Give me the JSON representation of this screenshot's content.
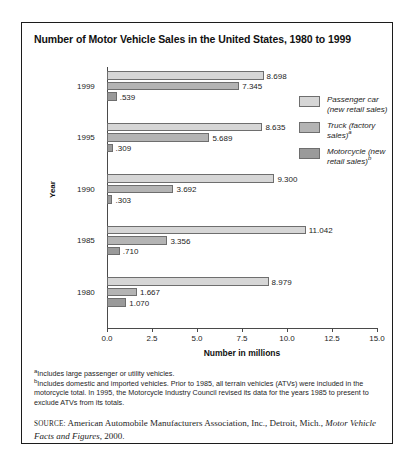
{
  "figure": {
    "title": "Number of Motor Vehicle Sales in the United States, 1980 to 1999",
    "xtitle": "Number in millions",
    "ytitle": "Year"
  },
  "legend": [
    {
      "label_line1": "Passenger car",
      "label_line2": "(new retail sales)",
      "sup": ""
    },
    {
      "label_line1": "Truck (factory",
      "label_line2": "sales)",
      "sup": "a"
    },
    {
      "label_line1": "Motorcycle (new",
      "label_line2": "retail sales)",
      "sup": "b"
    }
  ],
  "notes": {
    "a_sup": "a",
    "a_text": "Includes large passenger or utility vehicles.",
    "b_sup": "b",
    "b_text": "Includes domestic and imported vehicles. Prior to 1985, all terrain vehicles (ATVs) were included in the motorcycle total. In 1995, the Motorcycle Industry Council revised its data for the years 1985 to present to exclude ATVs from its totals.",
    "source_label": "SOURCE:",
    "source_text": " American Automobile Manufacturers Association, Inc., Detroit, Mich., ",
    "source_italic": "Motor Vehicle Facts and Figures",
    "source_tail": ", 2000."
  },
  "chart_data": {
    "type": "bar",
    "orientation": "horizontal",
    "title": "Number of Motor Vehicle Sales in the United States, 1980 to 1999",
    "xlabel": "Number in millions",
    "ylabel": "Year",
    "xlim": [
      0.0,
      15.0
    ],
    "xticks": [
      "0.0",
      "2.5",
      "5.0",
      "7.5",
      "10.0",
      "12.5",
      "15.0"
    ],
    "xtick_values": [
      0.0,
      2.5,
      5.0,
      7.5,
      10.0,
      12.5,
      15.0
    ],
    "grid": false,
    "legend_position": "right",
    "categories": [
      "1999",
      "1995",
      "1990",
      "1985",
      "1980"
    ],
    "series": [
      {
        "name": "Passenger car (new retail sales)",
        "values": [
          8.698,
          8.635,
          9.3,
          11.042,
          8.979
        ],
        "labels": [
          "8.698",
          "8.635",
          "9.300",
          "11.042",
          "8.979"
        ],
        "color": "#d6d6d6"
      },
      {
        "name": "Truck (factory sales)",
        "values": [
          7.345,
          5.689,
          3.692,
          3.356,
          1.667
        ],
        "labels": [
          "7.345",
          "5.689",
          "3.692",
          "3.356",
          "1.667"
        ],
        "color": "#b4b4b4"
      },
      {
        "name": "Motorcycle (new retail sales)",
        "values": [
          0.539,
          0.309,
          0.303,
          0.71,
          1.07
        ],
        "labels": [
          ".539",
          ".309",
          ".303",
          ".710",
          "1.070"
        ],
        "color": "#9a9a9a"
      }
    ]
  }
}
